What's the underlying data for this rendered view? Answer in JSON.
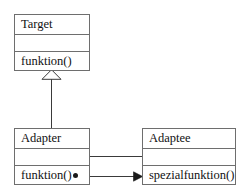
{
  "diagram": {
    "type": "uml-class-diagram",
    "background_color": "#ffffff",
    "line_color": "#6e6e6e",
    "text_color": "#111111",
    "classes": [
      {
        "id": "target",
        "name": "Target",
        "attributes": "",
        "operations": "funktion()"
      },
      {
        "id": "adapter",
        "name": "Adapter",
        "attributes": "",
        "operations": "funktion()"
      },
      {
        "id": "adaptee",
        "name": "Adaptee",
        "attributes": "",
        "operations": "spezialfunktion()"
      }
    ],
    "relations": [
      {
        "id": "generalization",
        "kind": "generalization",
        "from": "Adapter",
        "to": "Target",
        "head": "hollow-triangle",
        "label": ""
      },
      {
        "id": "association",
        "kind": "association",
        "from": "Adapter",
        "to": "Adaptee",
        "head": "none",
        "label": ""
      },
      {
        "id": "dependency",
        "kind": "call",
        "from": "funktion()",
        "to": "spezialfunktion()",
        "head": "solid-arrow",
        "source_marker": "filled-dot",
        "label": ""
      }
    ]
  }
}
